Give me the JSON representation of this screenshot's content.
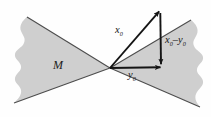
{
  "figure": {
    "name": "cone-decomposition-diagram",
    "background_color": "#fefefe",
    "cone_fill_color": "#cfcfcf",
    "cone_edge_color": "#4a4a4a",
    "vector_color": "#141414",
    "width": 211,
    "height": 117
  },
  "labels": {
    "cone_set": "M",
    "vector_x0": "x",
    "vector_x0_sub": "0",
    "vector_y0": "y",
    "vector_y0_sub": "0",
    "difference_x": "x",
    "difference_x_sub": "0",
    "difference_minus": "–",
    "difference_y": "y",
    "difference_y_sub": "0"
  },
  "geometry": {
    "vertex": {
      "x": 110,
      "y": 68
    },
    "x0_tip": {
      "x": 160,
      "y": 10
    },
    "y0_tip": {
      "x": 162,
      "y": 66
    },
    "diff_tail": {
      "x": 160,
      "y": 14
    },
    "diff_tip": {
      "x": 161,
      "y": 65
    }
  }
}
